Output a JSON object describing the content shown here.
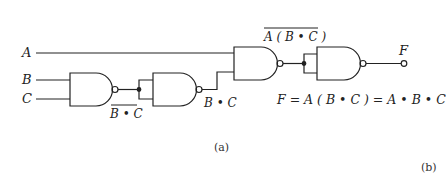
{
  "diagram": {
    "type": "logic-circuit",
    "inputs": [
      {
        "name": "A",
        "label": "A"
      },
      {
        "name": "B",
        "label": "B"
      },
      {
        "name": "C",
        "label": "C"
      }
    ],
    "output": {
      "name": "F",
      "label": "F"
    },
    "gates": [
      {
        "id": "g1",
        "type": "NAND",
        "inputs": [
          "B",
          "C"
        ],
        "output_label": "B • C",
        "output_overline": true
      },
      {
        "id": "g2",
        "type": "NAND",
        "inputs": [
          "g1",
          "g1"
        ],
        "output_label": "B • C",
        "output_overline": false
      },
      {
        "id": "g3",
        "type": "NAND",
        "inputs": [
          "A",
          "g2"
        ],
        "output_label": "A ( B • C )",
        "output_overline": true
      },
      {
        "id": "g4",
        "type": "NAND",
        "inputs": [
          "g3",
          "g3"
        ],
        "output_label": "F",
        "output_overline": false
      }
    ],
    "labels": {
      "a": "A",
      "b": "B",
      "c": "C",
      "g1_out": "B • C",
      "g2_out": "B • C",
      "g3_out": "A ( B • C )",
      "f": "F",
      "equation": "F = A ( B • C ) = A • B • C",
      "caption_a": "(a)",
      "caption_b": "(b)"
    },
    "colors": {
      "line": "#222222",
      "background": "#ffffff"
    }
  }
}
